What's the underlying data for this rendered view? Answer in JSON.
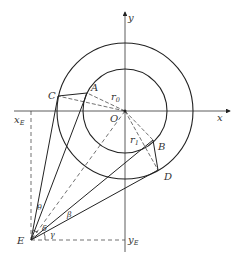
{
  "diagram": {
    "axes": {
      "x_label": "x",
      "y_label": "y"
    },
    "origin_label": "O",
    "points": {
      "A": "A",
      "B": "B",
      "C": "C",
      "D": "D",
      "E": "E"
    },
    "radii": {
      "r0": {
        "base": "r",
        "sub": "0"
      },
      "r1": {
        "base": "r",
        "sub": "1"
      }
    },
    "projections": {
      "xE": {
        "base": "x",
        "sub": "E"
      },
      "yE": {
        "base": "y",
        "sub": "E"
      }
    },
    "angles": {
      "theta": "θ",
      "delta": "δ",
      "beta": "β",
      "gamma": "γ"
    },
    "colors": {
      "stroke": "#222222",
      "background": "#ffffff"
    }
  }
}
